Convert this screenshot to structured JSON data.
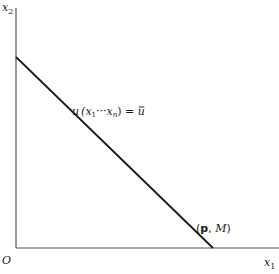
{
  "diagram": {
    "type": "budget-line",
    "axes": {
      "x_label": "x",
      "x_sub": "1",
      "y_label": "x",
      "y_sub": "2",
      "origin_label": "O"
    },
    "curve_label": {
      "text_u": "u",
      "text_args": "(x",
      "sub1": "1",
      "ellipsis": "···",
      "x_n": "x",
      "sub_n": "n",
      "close": ") = ",
      "ubar": "u"
    },
    "line_label": {
      "open": "(",
      "p": "p",
      "comma": ", ",
      "M": "M",
      "close": ")"
    },
    "colors": {
      "line": "#1a1a1a",
      "axis": "#555555"
    }
  }
}
